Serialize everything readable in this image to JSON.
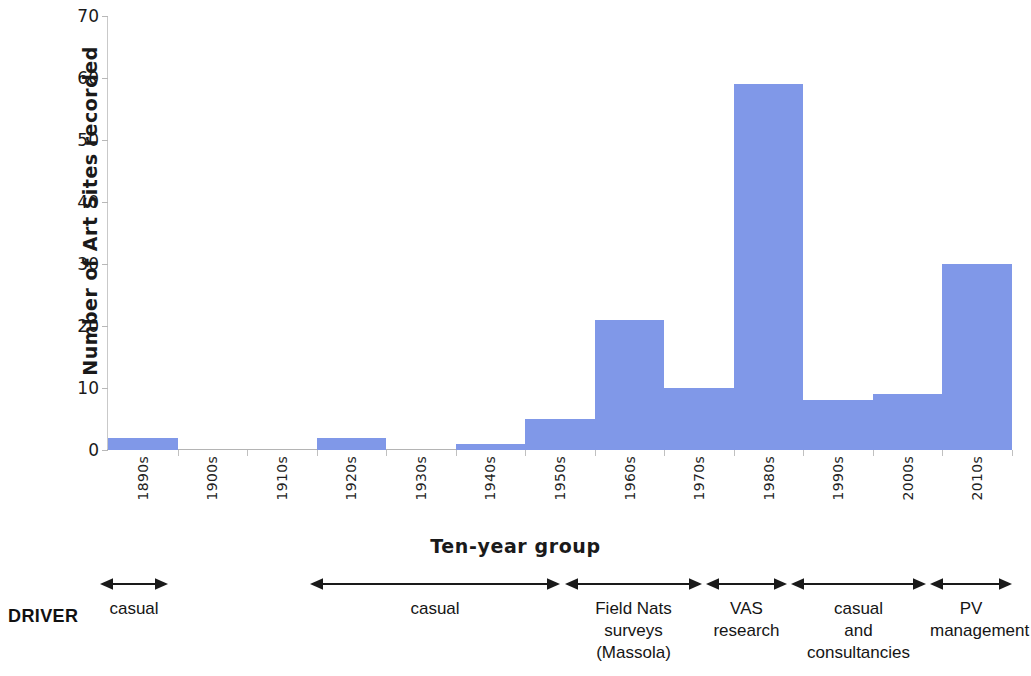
{
  "chart_data": {
    "type": "bar",
    "title": "",
    "xlabel": "Ten-year group",
    "ylabel": "Number of Art Sites recorded",
    "categories": [
      "1890s",
      "1900s",
      "1910s",
      "1920s",
      "1930s",
      "1940s",
      "1950s",
      "1960s",
      "1970s",
      "1980s",
      "1990s",
      "2000s",
      "2010s"
    ],
    "values": [
      2,
      0,
      0,
      2,
      0,
      1,
      5,
      21,
      10,
      59,
      8,
      9,
      30
    ],
    "ylim": [
      0,
      70
    ],
    "yticks": [
      0,
      10,
      20,
      30,
      40,
      50,
      60,
      70
    ],
    "grid": false,
    "legend": "none",
    "bar_color": "#8098e8",
    "axis_color": "#b8b8b8"
  },
  "axes": {
    "y_title": "Number of Art Sites recorded",
    "x_title": "Ten-year group",
    "y_tick_labels": [
      "70",
      "60",
      "50",
      "40",
      "30",
      "20",
      "10",
      "0"
    ],
    "x_tick_labels": [
      "1890s",
      "1900s",
      "1910s",
      "1920s",
      "1930s",
      "1940s",
      "1950s",
      "1960s",
      "1970s",
      "1980s",
      "1990s",
      "2000s",
      "2010s"
    ]
  },
  "driver": {
    "row_label": "DRIVER",
    "segments": [
      {
        "label": "casual",
        "arrow": "double"
      },
      {
        "label": "casual",
        "arrow": "double"
      },
      {
        "label": "Field Nats\nsurveys\n(Massola)",
        "arrow": "double"
      },
      {
        "label": "VAS\nresearch",
        "arrow": "double"
      },
      {
        "label": "casual\nand\nconsultancies",
        "arrow": "double"
      },
      {
        "label": "PV\nmanagement",
        "arrow": "double"
      }
    ]
  }
}
